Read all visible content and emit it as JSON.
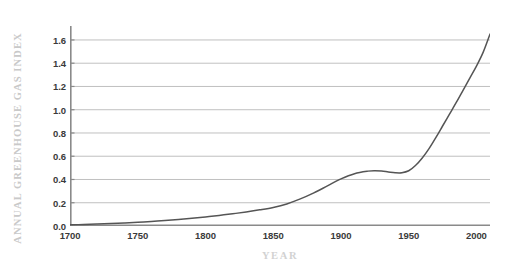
{
  "chart_data": {
    "type": "line",
    "title": "",
    "xlabel": "YEAR",
    "ylabel": "ANNUAL GREENHOUSE GAS INDEX",
    "xlim": [
      1700,
      2010
    ],
    "ylim": [
      0.0,
      1.72
    ],
    "grid": true,
    "legend": null,
    "xticks": [
      1700,
      1750,
      1800,
      1850,
      1900,
      1950,
      2000
    ],
    "xtick_labels": [
      "1700",
      "1750",
      "1800",
      "1850",
      "1900",
      "1950",
      "2000"
    ],
    "yticks": [
      0.0,
      0.2,
      0.4,
      0.6,
      0.8,
      1.0,
      1.2,
      1.4,
      1.6
    ],
    "ytick_labels": [
      "0.0",
      "0.2",
      "0.4",
      "0.6",
      "0.8",
      "1.0",
      "1.2",
      "1.4",
      "1.6"
    ],
    "line_color": "#555555",
    "grid_color": "#b9b9b9",
    "axis_color": "#8a8a8a",
    "tick_label_color": "#3a3a3a",
    "axis_title_color": "#cccccc",
    "series": [
      {
        "name": "Annual Greenhouse Gas Index",
        "x": [
          1700,
          1710,
          1720,
          1730,
          1740,
          1750,
          1760,
          1770,
          1780,
          1790,
          1800,
          1810,
          1820,
          1830,
          1840,
          1850,
          1860,
          1870,
          1880,
          1890,
          1900,
          1910,
          1920,
          1925,
          1930,
          1935,
          1940,
          1945,
          1950,
          1955,
          1960,
          1965,
          1970,
          1975,
          1980,
          1985,
          1990,
          1995,
          2000,
          2005,
          2010
        ],
        "y": [
          0.01,
          0.013,
          0.017,
          0.021,
          0.026,
          0.032,
          0.039,
          0.047,
          0.056,
          0.066,
          0.078,
          0.091,
          0.105,
          0.121,
          0.139,
          0.16,
          0.19,
          0.233,
          0.285,
          0.345,
          0.405,
          0.45,
          0.472,
          0.476,
          0.473,
          0.465,
          0.458,
          0.458,
          0.475,
          0.52,
          0.585,
          0.665,
          0.76,
          0.86,
          0.96,
          1.06,
          1.165,
          1.27,
          1.375,
          1.495,
          1.65
        ]
      }
    ],
    "annotations": [
      {
        "text": "plateau",
        "x_range": [
          1920,
          1948
        ],
        "y_approx": 0.46
      },
      {
        "text": "steep rise",
        "x_range": [
          1950,
          2010
        ],
        "y_range": [
          0.475,
          1.65
        ]
      }
    ]
  },
  "axis_titles": {
    "y": "ANNUAL GREENHOUSE GAS INDEX",
    "x": "YEAR"
  }
}
